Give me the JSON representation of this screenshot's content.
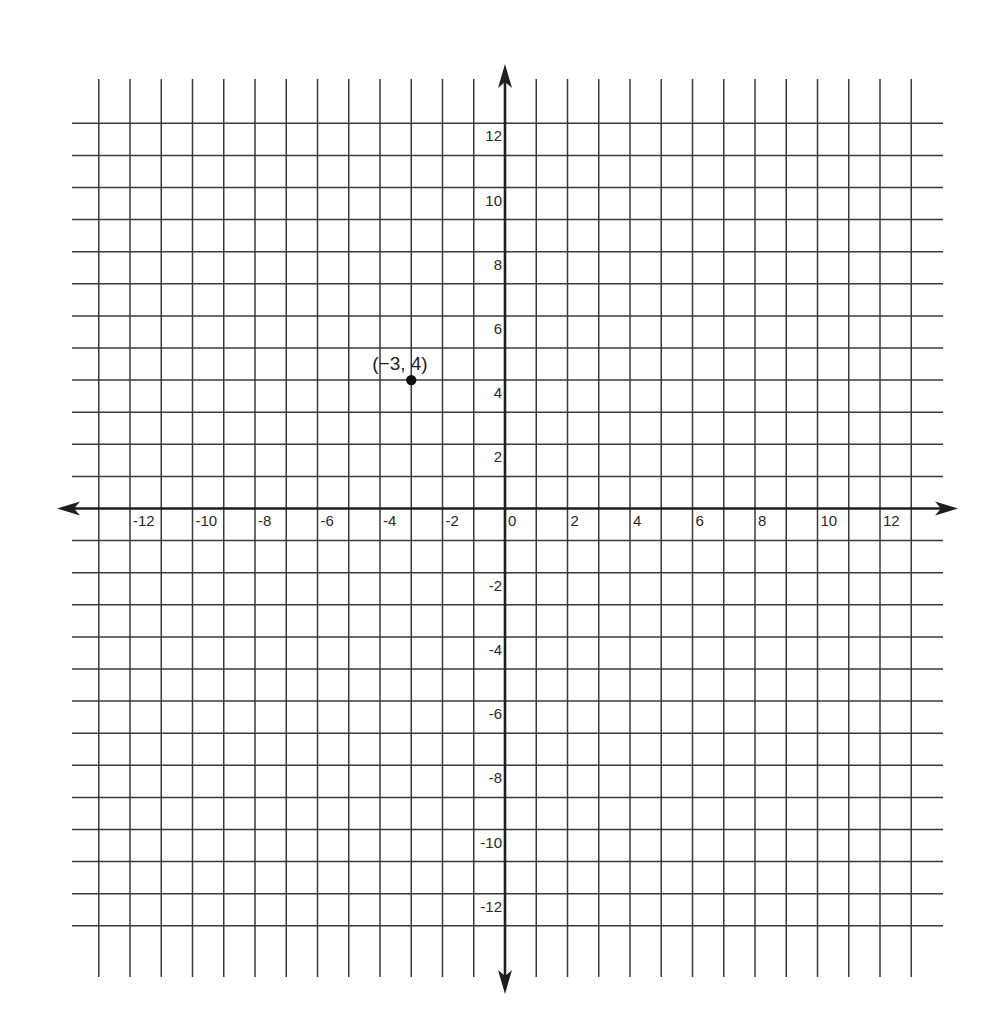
{
  "chart_data": {
    "type": "scatter",
    "title": "",
    "xlabel": "",
    "ylabel": "",
    "xlim": [
      -13,
      13
    ],
    "ylim": [
      -13,
      12
    ],
    "grid": true,
    "grid_step": 1,
    "legend": null,
    "x_tick_labels": [
      "-12",
      "-10",
      "-8",
      "-6",
      "-4",
      "-2",
      "0",
      "2",
      "4",
      "6",
      "8",
      "10",
      "12"
    ],
    "x_tick_values": [
      -12,
      -10,
      -8,
      -6,
      -4,
      -2,
      0,
      2,
      4,
      6,
      8,
      10,
      12
    ],
    "y_tick_labels": [
      "12",
      "10",
      "8",
      "6",
      "4",
      "2",
      "-2",
      "-4",
      "-6",
      "-8",
      "-10",
      "-12"
    ],
    "y_tick_values": [
      12,
      10,
      8,
      6,
      4,
      2,
      -2,
      -4,
      -6,
      -8,
      -10,
      -12
    ],
    "points": [
      {
        "x": -3,
        "y": 4,
        "label": "(−3, 4)"
      }
    ],
    "axes_arrows": true
  },
  "colors": {
    "grid": "#3a3a3a",
    "axis": "#1e1e1e",
    "point": "#111111",
    "background": "#ffffff"
  }
}
